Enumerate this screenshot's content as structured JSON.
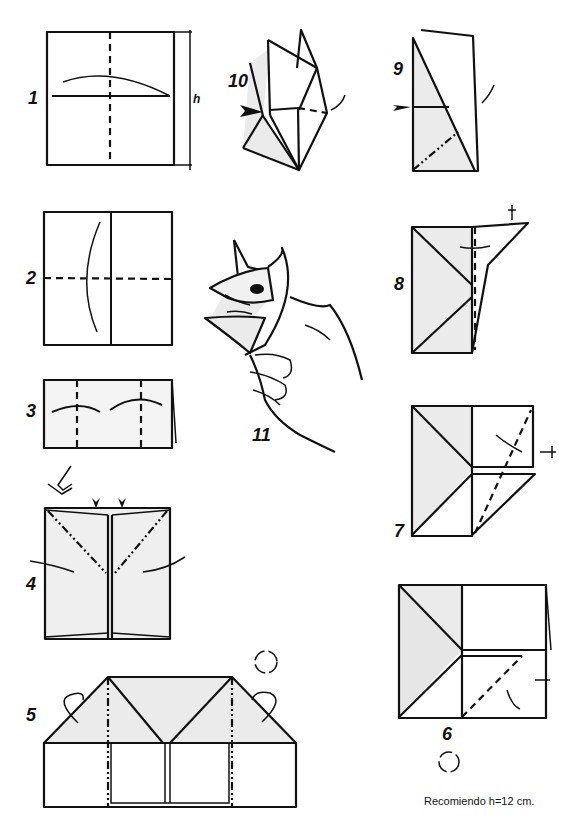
{
  "diagram": {
    "steps": [
      {
        "n": "1",
        "label": "1",
        "dimension_label": "h"
      },
      {
        "n": "2",
        "label": "2"
      },
      {
        "n": "3",
        "label": "3"
      },
      {
        "n": "4",
        "label": "4"
      },
      {
        "n": "5",
        "label": "5"
      },
      {
        "n": "6",
        "label": "6"
      },
      {
        "n": "7",
        "label": "7"
      },
      {
        "n": "8",
        "label": "8"
      },
      {
        "n": "9",
        "label": "9"
      },
      {
        "n": "10",
        "label": "10"
      },
      {
        "n": "11",
        "label": "11"
      }
    ],
    "note": "Recomiendo h=12 cm.",
    "colors": {
      "line": "#111111",
      "shade": "#ebebeb",
      "background": "#ffffff"
    }
  }
}
